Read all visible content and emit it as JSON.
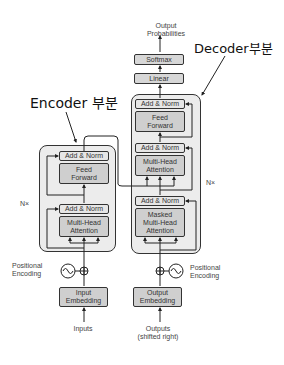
{
  "labels": {
    "encoder_label": "Encoder 부분",
    "decoder_label": "Decoder부분",
    "output_probabilities": [
      "Output",
      "Probabilities"
    ],
    "encoder_repeat": "N×",
    "decoder_repeat": "N×",
    "positional_encoding_left": [
      "Positional",
      "Encoding"
    ],
    "positional_encoding_right": [
      "Positional",
      "Encoding"
    ],
    "inputs": "Inputs",
    "outputs": [
      "Outputs",
      "(shifted right)"
    ]
  },
  "decoder_top": {
    "softmax": "Softmax",
    "linear": "Linear"
  },
  "encoder": {
    "add_norm_top": "Add & Norm",
    "feed_forward": [
      "Feed",
      "Forward"
    ],
    "add_norm_bottom": "Add & Norm",
    "multi_head_attention": [
      "Multi-Head",
      "Attention"
    ],
    "embedding": [
      "Input",
      "Embedding"
    ]
  },
  "decoder": {
    "add_norm_top": "Add & Norm",
    "feed_forward": [
      "Feed",
      "Forward"
    ],
    "add_norm_mid": "Add & Norm",
    "multi_head_attention": [
      "Multi-Head",
      "Attention"
    ],
    "add_norm_bottom": "Add & Norm",
    "masked_attention": [
      "Masked",
      "Multi-Head",
      "Attention"
    ],
    "embedding": [
      "Output",
      "Embedding"
    ]
  },
  "colors": {
    "panel_bg": "#ececec",
    "block_fill": "#cfcfcf",
    "addnorm_fill": "#e6e6e6",
    "stroke": "#333333"
  }
}
